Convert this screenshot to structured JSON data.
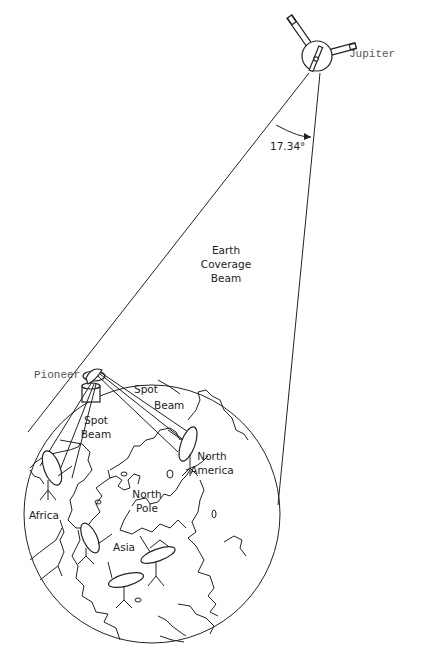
{
  "diagram": {
    "labels": {
      "jupiter": "Jupiter",
      "pioneer": "Pioneer",
      "angle": "17.34°",
      "earth_coverage_beam": [
        "Earth",
        "Coverage",
        "Beam"
      ],
      "spot_beam_upper": [
        "Spot",
        "Beam"
      ],
      "spot_beam_left": [
        "Spot",
        "Beam"
      ],
      "north_america": [
        "North",
        "America"
      ],
      "africa": "Africa",
      "north_pole": [
        "North",
        "Pole"
      ],
      "asia": "Asia"
    },
    "colors": {
      "line": "#222222",
      "background": "#ffffff",
      "mono_label": "#555555"
    }
  }
}
